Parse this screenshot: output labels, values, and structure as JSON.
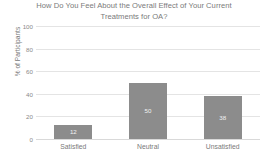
{
  "chart_data": {
    "type": "bar",
    "title": "How Do You Feel About the Overall Effect of Your Current Treatments for OA?",
    "title_line1": "How Do You Feel About the Overall Effect of Your Current",
    "title_line2": "Treatments for OA?",
    "categories": [
      "Satisfied",
      "Neutral",
      "Unsatisfied"
    ],
    "values": [
      12,
      50,
      38
    ],
    "xlabel": "",
    "ylabel": "% of Participants",
    "ylim": [
      0,
      100
    ],
    "yticks": [
      100,
      80,
      60,
      40,
      20,
      0
    ],
    "grid": true,
    "legend": false,
    "data_labels": [
      "12",
      "50",
      "38"
    ],
    "colors": {
      "bar": "#8c8c8c",
      "gridline": "#e4e4e4",
      "text": "#7a7a7a",
      "data_label_text": "#f2f2f2",
      "background": "#ffffff"
    }
  }
}
